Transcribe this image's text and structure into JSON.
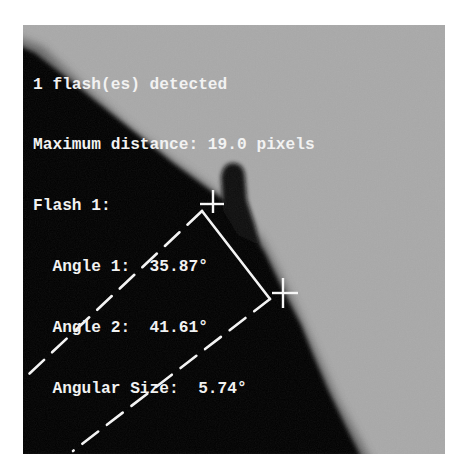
{
  "image": {
    "description": "Grayscale solar limb image with prominence/flash detection overlay",
    "background_color": "#a9a9a9",
    "dark_region_color": "#050505",
    "overlay_color": "#f4f4f4"
  },
  "annotation": {
    "lines": [
      "1 flash(es) detected",
      "Maximum distance: 19.0 pixels",
      "Flash 1:",
      "  Angle 1:  35.87°",
      "  Angle 2:  41.61°",
      "  Angular Size:  5.74°"
    ],
    "flash_count": 1,
    "max_distance_px": 19.0,
    "flashes": [
      {
        "id": 1,
        "angle_1_deg": 35.87,
        "angle_2_deg": 41.61,
        "angular_size_deg": 5.74
      }
    ]
  },
  "markers": {
    "crosshair_1": {
      "x": 190,
      "y": 179,
      "icon": "crosshair-icon"
    },
    "crosshair_2": {
      "x": 260,
      "y": 268,
      "icon": "crosshair-icon"
    },
    "solid_line": {
      "x1": 179,
      "y1": 186,
      "x2": 247,
      "y2": 274
    },
    "dashed_line_1": {
      "x1": 179,
      "y1": 186,
      "x2": 5,
      "y2": 350
    },
    "dashed_line_2": {
      "x1": 247,
      "y1": 274,
      "x2": 50,
      "y2": 426
    }
  }
}
